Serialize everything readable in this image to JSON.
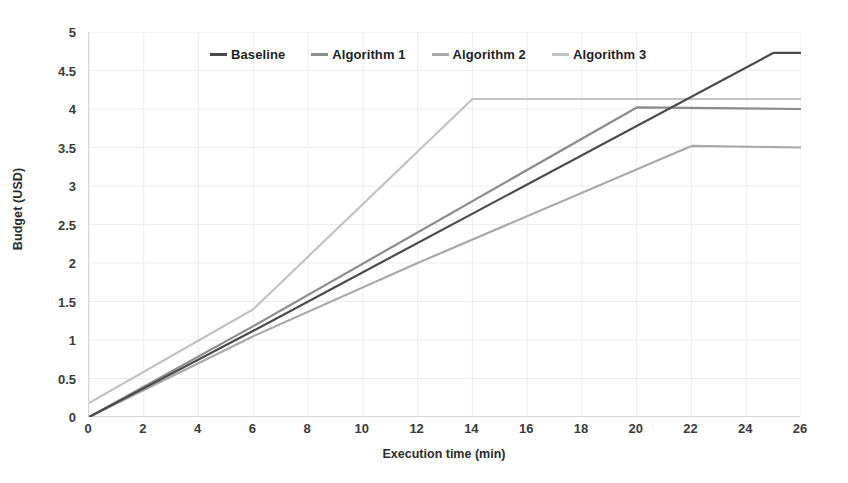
{
  "chart_data": {
    "type": "line",
    "title": "",
    "xlabel": "Execution time (min)",
    "ylabel": "Budget (USD)",
    "xlim": [
      0,
      26
    ],
    "ylim": [
      0,
      5
    ],
    "xticks": [
      0,
      2,
      4,
      6,
      8,
      10,
      12,
      14,
      16,
      18,
      20,
      22,
      24,
      26
    ],
    "yticks": [
      0,
      0.5,
      1,
      1.5,
      2,
      2.5,
      3,
      3.5,
      4,
      4.5,
      5
    ],
    "xtick_labels": [
      "0",
      "2",
      "4",
      "6",
      "8",
      "10",
      "12",
      "14",
      "16",
      "18",
      "20",
      "22",
      "24",
      "26"
    ],
    "ytick_labels": [
      "0",
      "0.5",
      "1",
      "1.5",
      "2",
      "2.5",
      "3",
      "3.5",
      "4",
      "4.5",
      "5"
    ],
    "grid": true,
    "legend_position": "top-center",
    "series": [
      {
        "name": "Baseline",
        "color": "#4a4a4a",
        "x": [
          0,
          6,
          25,
          26
        ],
        "y": [
          0,
          1.12,
          4.73,
          4.73
        ]
      },
      {
        "name": "Algorithm 1",
        "color": "#8c8c8c",
        "x": [
          0,
          6,
          20,
          26
        ],
        "y": [
          0,
          1.18,
          4.02,
          4.0
        ]
      },
      {
        "name": "Algorithm 2",
        "color": "#a8a8a8",
        "x": [
          0,
          6,
          12,
          22,
          26
        ],
        "y": [
          0,
          1.05,
          2.0,
          3.52,
          3.5
        ]
      },
      {
        "name": "Algorithm 3",
        "color": "#c2c2c2",
        "x": [
          0,
          6,
          14,
          26
        ],
        "y": [
          0.18,
          1.4,
          4.13,
          4.13
        ]
      }
    ]
  },
  "legend": {
    "items": [
      {
        "label": "Baseline",
        "color": "#4a4a4a"
      },
      {
        "label": "Algorithm 1",
        "color": "#8c8c8c"
      },
      {
        "label": "Algorithm 2",
        "color": "#a8a8a8"
      },
      {
        "label": "Algorithm 3",
        "color": "#c2c2c2"
      }
    ]
  },
  "style": {
    "grid_color": "#ededed",
    "axis_color": "#c9c9c9",
    "background": "#ffffff",
    "text_color": "#2b2b2b"
  }
}
